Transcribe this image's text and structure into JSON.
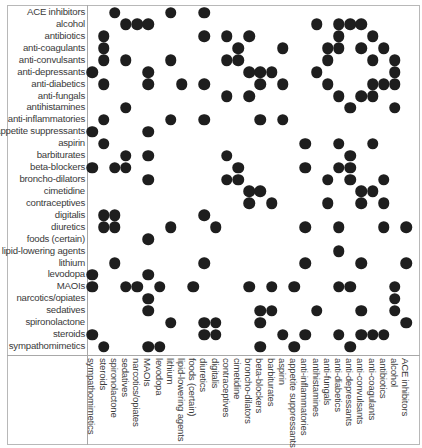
{
  "chart_data": {
    "type": "heatmap",
    "title": "",
    "subtitle": "Drug interaction matrix (dot = interaction)",
    "rows": [
      "ACE inhibitors",
      "alcohol",
      "antibiotics",
      "anti-coagulants",
      "anti-convulsants",
      "anti-depressants",
      "anti-diabetics",
      "anti-fungals",
      "antihistamines",
      "anti-inflammatories",
      "appetite suppressants",
      "aspirin",
      "barbiturates",
      "beta-blockers",
      "broncho-dilators",
      "cimetidine",
      "contraceptives",
      "digitalis",
      "diuretics",
      "foods (certain)",
      "lipid-lowering agents",
      "lithium",
      "levodopa",
      "MAOIs",
      "narcotics/opiates",
      "sedatives",
      "spironolactone",
      "steroids",
      "sympathomimetics"
    ],
    "columns": [
      "sympathomimetics",
      "steroids",
      "spironolactone",
      "sedatives",
      "narcotics/opiates",
      "MAOIs",
      "levodopa",
      "lithium",
      "lipid-lowering agents",
      "foods (certain)",
      "diuretics",
      "digitalis",
      "contraceptives",
      "cimetidine",
      "broncho-dilators",
      "beta-blockers",
      "barbiturates",
      "aspirin",
      "appetite suppressants",
      "anti-inflammatories",
      "antihistamines",
      "anti-fungals",
      "anti-diabetics",
      "anti-depressants",
      "anti-convulsants",
      "anti-coagulants",
      "antibiotics",
      "alcohol",
      "ACE inhibitors"
    ],
    "interactions": [
      [
        2,
        7,
        10
      ],
      [
        3,
        4,
        5,
        20,
        22,
        23,
        24
      ],
      [
        1,
        10,
        12,
        14,
        22,
        25
      ],
      [
        1,
        13,
        17,
        21,
        22,
        24,
        26
      ],
      [
        1,
        3,
        7,
        12,
        13,
        21,
        25,
        27
      ],
      [
        0,
        5,
        14,
        15,
        16,
        20,
        27
      ],
      [
        1,
        5,
        8,
        10,
        15,
        17,
        21,
        25,
        26,
        27
      ],
      [
        12,
        14,
        22,
        24,
        25
      ],
      [
        3,
        23,
        27
      ],
      [
        1,
        7,
        10,
        15,
        17
      ],
      [
        0,
        5
      ],
      [
        1,
        19,
        22,
        25
      ],
      [
        3,
        5,
        12,
        23
      ],
      [
        0,
        2,
        3,
        13,
        19,
        22,
        23
      ],
      [
        5,
        12,
        13,
        21,
        23,
        26
      ],
      [
        14,
        15,
        24,
        25
      ],
      [
        14,
        16,
        21,
        24,
        26
      ],
      [
        1,
        2,
        10
      ],
      [
        1,
        2,
        7,
        11,
        19,
        22,
        26,
        28
      ],
      [
        5
      ],
      [
        22
      ],
      [
        2,
        10,
        19,
        24,
        28
      ],
      [
        0,
        5
      ],
      [
        0,
        3,
        4,
        6,
        9,
        14,
        16,
        18,
        22,
        23,
        27
      ],
      [
        5,
        27
      ],
      [
        5,
        15,
        16,
        20,
        24,
        27
      ],
      [
        7,
        10,
        11,
        15,
        28
      ],
      [
        0,
        10,
        11,
        17,
        19,
        22,
        24,
        25,
        26
      ],
      [
        1,
        5,
        6,
        15,
        18,
        23
      ]
    ],
    "xlabel": "",
    "ylabel": "",
    "grid": false,
    "legend": "none",
    "dot_color": "#1e1e1e"
  }
}
